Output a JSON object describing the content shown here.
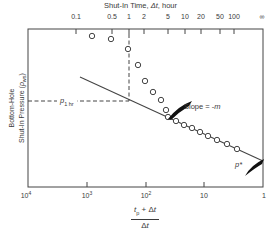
{
  "colors": {
    "background": "#ffffff",
    "ink": "#3a3a3a",
    "line": "#444444",
    "arrow": "#111111"
  },
  "figure": {
    "top_axis": {
      "title_pre": "Shut-In Time, ",
      "title_italic": "Δt",
      "title_post": ", hour",
      "ticks": [
        {
          "label": "0.1",
          "x": 76,
          "tick": true
        },
        {
          "label": "0.5",
          "x": 112,
          "tick": true
        },
        {
          "label": "1",
          "x": 129,
          "tick": true
        },
        {
          "label": "2",
          "x": 144,
          "tick": true
        },
        {
          "label": "5",
          "x": 168,
          "tick": true
        },
        {
          "label": "10",
          "x": 185,
          "tick": true
        },
        {
          "label": "20",
          "x": 201,
          "tick": true
        },
        {
          "label": "50",
          "x": 220,
          "tick": true
        },
        {
          "label": "100",
          "x": 234,
          "tick": true
        },
        {
          "label": "∞",
          "x": 262,
          "tick": false
        }
      ]
    },
    "bottom_axis": {
      "ticks": [
        {
          "base": "10",
          "sup": "4",
          "x": 26,
          "tick": false
        },
        {
          "base": "10",
          "sup": "3",
          "x": 87,
          "tick": true
        },
        {
          "base": "10",
          "sup": "2",
          "x": 146,
          "tick": true
        },
        {
          "base": "10",
          "sup": "",
          "x": 204,
          "tick": true
        },
        {
          "base": "1",
          "sup": "",
          "x": 264,
          "tick": false
        }
      ],
      "fraction": {
        "num_t": "t",
        "num_sub": "p",
        "num_mid": " + Δ",
        "num_t2": "t",
        "den_pre": "Δ",
        "den_t": "t"
      }
    },
    "y_axis": {
      "line1": "Bottom-Hole",
      "line2_pre": "Shut-In Pressure (",
      "line2_italic": "p",
      "line2_sub": "ws",
      "line2_post": ")"
    },
    "annotations": {
      "p1hr_base": "p",
      "p1hr_sub": "1 hr",
      "slope_pre": "Slope = -",
      "slope_italic": "m",
      "pstar_base": "p",
      "pstar_sup": "*"
    }
  },
  "chart_data": {
    "type": "scatter",
    "title": "Shut-In Time, Δt, hour",
    "x_bottom_label": "(tp + Δt) / Δt",
    "x_bottom_scale": "log",
    "x_bottom_range": [
      10000,
      1
    ],
    "x_top_label": "Shut-In Time, Δt, hour",
    "x_top_ticks": [
      "0.1",
      "0.5",
      "1",
      "2",
      "5",
      "10",
      "20",
      "50",
      "100",
      "∞"
    ],
    "ylabel": "Bottom-Hole Shut-In Pressure (pws)",
    "y_scale": "linear, unlabeled (arbitrary pressure)",
    "annotations": [
      "p1 hr",
      "Slope = -m",
      "p*"
    ],
    "horner_ratio_values": [
      815,
      386,
      199,
      134,
      102,
      75,
      54,
      45,
      41,
      30,
      22,
      16,
      12,
      8.6,
      6.1,
      4.1,
      2.8
    ],
    "geometry": {
      "frame": {
        "left": 28,
        "top": 29,
        "right": 263,
        "bottom": 187
      },
      "tick_length": 5,
      "circle_radius": 2.7,
      "points_px": [
        [
          92,
          36
        ],
        [
          111,
          39
        ],
        [
          128,
          49
        ],
        [
          138,
          65
        ],
        [
          145,
          81
        ],
        [
          153,
          92
        ],
        [
          161,
          100
        ],
        [
          166,
          110
        ],
        [
          168,
          117
        ],
        [
          176,
          121
        ],
        [
          184,
          125
        ],
        [
          192,
          128
        ],
        [
          200,
          132
        ],
        [
          208,
          136
        ],
        [
          217,
          140
        ],
        [
          227,
          144
        ],
        [
          237,
          149
        ]
      ],
      "straight_line": {
        "x1": 80,
        "y1": 77,
        "x2": 263,
        "y2": 161
      },
      "dashed_horizontal": {
        "y": 101,
        "x1": 28,
        "x2": 129
      },
      "dashed_vertical": {
        "x": 129,
        "y1": 34,
        "y2": 101
      },
      "slope_arrow_path": "M 168 119 Q 178 106 192 101 L 189 106 Q 179 112 171 120 Z",
      "pstar_arrow_path": "M 245 176 Q 251 165 264 159 L 262 164 Q 255 168 245 176 Z"
    }
  }
}
